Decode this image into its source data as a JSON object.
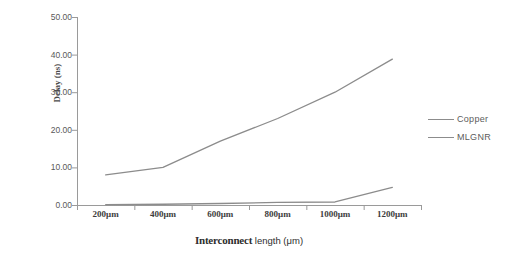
{
  "chart_data": {
    "type": "line",
    "title": "",
    "xlabel_bold": "Interconnect",
    "xlabel_plain": " length (μm)",
    "ylabel": "Delay (ns)",
    "categories": [
      "200μm",
      "400μm",
      "600μm",
      "800μm",
      "1000μm",
      "1200μm"
    ],
    "ylim": [
      0,
      50
    ],
    "ytick_values": [
      0,
      10,
      20,
      30,
      40,
      50
    ],
    "ytick_labels": [
      "0.00",
      "10.00",
      "20.00",
      "30.00",
      "40.00",
      "50.00"
    ],
    "grid": false,
    "legend_position": "right",
    "series": [
      {
        "name": "Copper",
        "color": "#8c8c8c",
        "values": [
          8.0,
          10.0,
          17.0,
          23.0,
          30.0,
          38.8
        ]
      },
      {
        "name": "MLGNR",
        "color": "#8c8c8c",
        "values": [
          0.1,
          0.2,
          0.4,
          0.7,
          0.8,
          4.7
        ]
      }
    ]
  },
  "axis": {
    "line_color": "#9a9a9a"
  }
}
